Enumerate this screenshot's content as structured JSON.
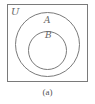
{
  "diagram": {
    "type": "venn",
    "universe_label": "U",
    "sets": [
      {
        "label": "A",
        "role": "outer"
      },
      {
        "label": "B",
        "role": "inner",
        "subset_of": "A"
      }
    ],
    "caption": "(a)",
    "stroke_color": "#7a7a7a"
  }
}
